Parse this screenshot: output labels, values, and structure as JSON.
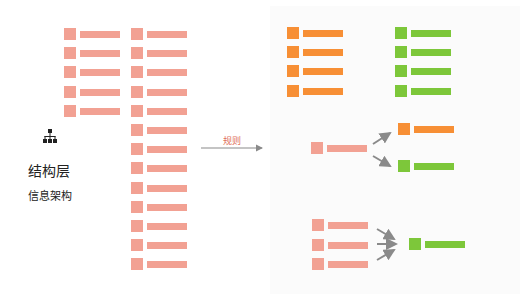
{
  "left": {
    "icon": "sitemap-icon",
    "title": "结构层",
    "subtitle": "信息架构",
    "col1_rows": 5,
    "col2_rows": 13
  },
  "transition": {
    "label": "规则",
    "icon": "arrow-right-icon"
  },
  "right": {
    "groups": [
      {
        "name": "orange-list",
        "rows": 4
      },
      {
        "name": "green-list",
        "rows": 4
      },
      {
        "name": "split",
        "from": 1,
        "to": [
          "orange",
          "green"
        ]
      },
      {
        "name": "merge",
        "from": 3,
        "to": [
          "green"
        ]
      }
    ]
  },
  "colors": {
    "pink": "#f2a193",
    "orange": "#f78f35",
    "green": "#7dc73a",
    "arrow": "#8a8a8a",
    "label": "#e0705a"
  }
}
